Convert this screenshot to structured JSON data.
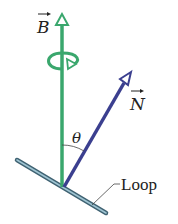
{
  "diagram": {
    "labels": {
      "field": "B",
      "normal": "N",
      "angle": "θ",
      "loop": "Loop"
    },
    "colors": {
      "field_vector": "#3aa76d",
      "normal_vector": "#3b3f8f",
      "loop": "#6a8fa0",
      "text": "#222222"
    }
  }
}
